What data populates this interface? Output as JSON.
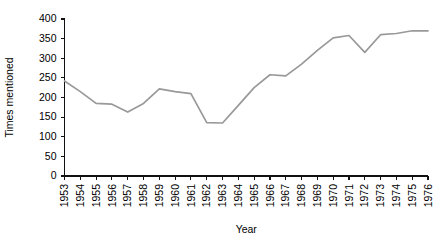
{
  "chart_data": {
    "type": "line",
    "title": "",
    "subtitle": "",
    "xlabel": "Year",
    "ylabel": "Times mentioned",
    "categories": [
      "1953",
      "1954",
      "1955",
      "1956",
      "1957",
      "1958",
      "1959",
      "1960",
      "1961",
      "1962",
      "1963",
      "1964",
      "1965",
      "1966",
      "1967",
      "1968",
      "1969",
      "1970",
      "1971",
      "1972",
      "1973",
      "1974",
      "1975",
      "1976"
    ],
    "values": [
      242,
      215,
      185,
      183,
      163,
      185,
      222,
      215,
      210,
      136,
      135,
      180,
      225,
      258,
      255,
      285,
      320,
      352,
      358,
      315,
      360,
      363,
      370,
      370
    ],
    "series": [
      {
        "name": "Times mentioned",
        "color": "#999999",
        "values": [
          242,
          215,
          185,
          183,
          163,
          185,
          222,
          215,
          210,
          136,
          135,
          180,
          225,
          258,
          255,
          285,
          320,
          352,
          358,
          315,
          360,
          363,
          370,
          370
        ]
      }
    ],
    "x": [
      "1953",
      "1954",
      "1955",
      "1956",
      "1957",
      "1958",
      "1959",
      "1960",
      "1961",
      "1962",
      "1963",
      "1964",
      "1965",
      "1966",
      "1967",
      "1968",
      "1969",
      "1970",
      "1971",
      "1972",
      "1973",
      "1974",
      "1975",
      "1976"
    ],
    "ylim": [
      0,
      400
    ],
    "ytick_labels": [
      "0",
      "50",
      "100",
      "150",
      "200",
      "250",
      "300",
      "350",
      "400"
    ],
    "ytick_values": [
      0,
      50,
      100,
      150,
      200,
      250,
      300,
      350,
      400
    ],
    "xtick_labels": [
      "1953",
      "1954",
      "1955",
      "1956",
      "1957",
      "1958",
      "1959",
      "1960",
      "1961",
      "1962",
      "1963",
      "1964",
      "1965",
      "1966",
      "1967",
      "1968",
      "1969",
      "1970",
      "1971",
      "1972",
      "1973",
      "1974",
      "1975",
      "1976"
    ],
    "xtick_rotation": 90,
    "grid": false,
    "legend": false,
    "legend_position": "none",
    "axis_color": "#111111",
    "background_color": "#ffffff"
  }
}
